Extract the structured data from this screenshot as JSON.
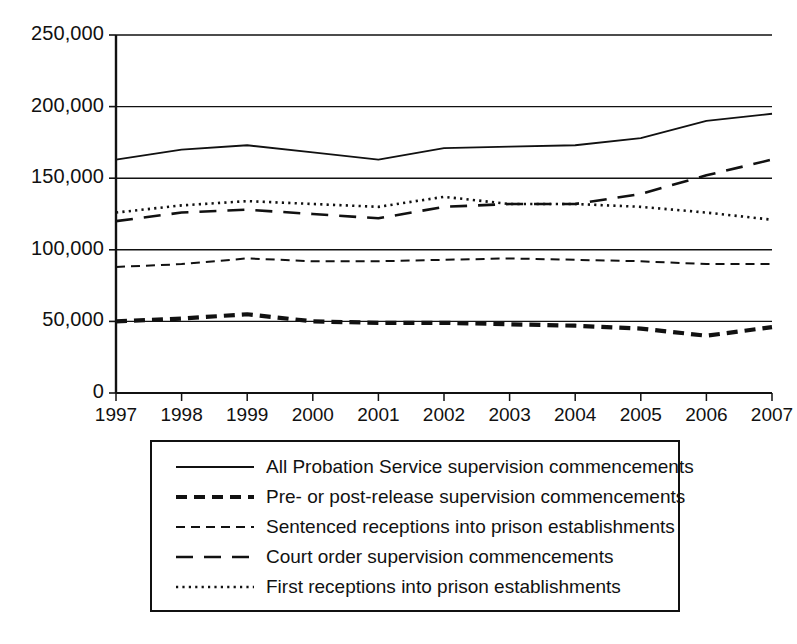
{
  "chart_data": {
    "type": "line",
    "title": "",
    "xlabel": "",
    "ylabel": "",
    "ylim": [
      0,
      250000
    ],
    "yticks": [
      "0",
      "50,000",
      "100,000",
      "150,000",
      "200,000",
      "250,000"
    ],
    "ytick_values": [
      0,
      50000,
      100000,
      150000,
      200000,
      250000
    ],
    "grid": "horizontal",
    "legend_position": "below-plot",
    "categories": [
      "1997",
      "1998",
      "1999",
      "2000",
      "2001",
      "2002",
      "2003",
      "2004",
      "2005",
      "2006",
      "2007"
    ],
    "x": [
      1997,
      1998,
      1999,
      2000,
      2001,
      2002,
      2003,
      2004,
      2005,
      2006,
      2007
    ],
    "series": [
      {
        "name": "All Probation Service supervision commencements",
        "style": "solid",
        "values": [
          163000,
          170000,
          173000,
          168000,
          163000,
          171000,
          172000,
          173000,
          178000,
          190000,
          195000
        ]
      },
      {
        "name": "Pre- or post-release supervision commencements",
        "style": "bold-dashed",
        "values": [
          50000,
          52000,
          55000,
          50000,
          49000,
          49000,
          48000,
          47000,
          45000,
          40000,
          46000
        ]
      },
      {
        "name": "Sentenced receptions into prison establishments",
        "style": "short-dashed",
        "values": [
          88000,
          90000,
          94000,
          92000,
          92000,
          93000,
          94000,
          93000,
          92000,
          90000,
          90000
        ]
      },
      {
        "name": "Court order supervision commencements",
        "style": "long-dashed",
        "values": [
          120000,
          126000,
          128000,
          125000,
          122000,
          130000,
          132000,
          132000,
          139000,
          152000,
          163000
        ]
      },
      {
        "name": "First receptions into prison establishments",
        "style": "dotted",
        "values": [
          126000,
          131000,
          134000,
          132000,
          130000,
          137000,
          132000,
          132000,
          130000,
          126000,
          121000
        ]
      }
    ]
  },
  "legend": {
    "items": [
      {
        "label": "All Probation Service supervision commencements",
        "style": "solid"
      },
      {
        "label": "Pre- or post-release supervision commencements",
        "style": "bold-dashed"
      },
      {
        "label": "Sentenced receptions into prison establishments",
        "style": "short-dashed"
      },
      {
        "label": "Court order supervision commencements",
        "style": "long-dashed"
      },
      {
        "label": "First receptions into prison establishments",
        "style": "dotted"
      }
    ]
  }
}
